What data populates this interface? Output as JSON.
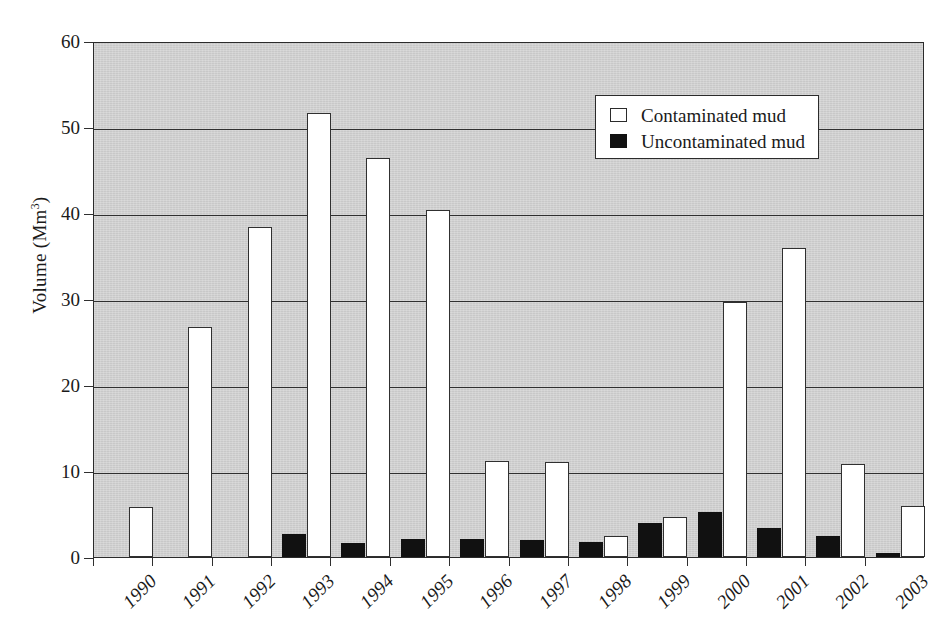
{
  "chart_data": {
    "type": "bar",
    "title": "",
    "xlabel": "",
    "ylabel": "Volume (Mm3)",
    "ylabel_base": "Volume (Mm",
    "ylabel_sup": "3",
    "ylabel_tail": ")",
    "ylim": [
      0,
      60
    ],
    "ytick_labels": [
      "60",
      "50",
      "40",
      "30",
      "20",
      "10",
      "0"
    ],
    "ytick_values": [
      60,
      50,
      40,
      30,
      20,
      10,
      0
    ],
    "grid": true,
    "grid_axis": "y",
    "legend_position": "top-right",
    "categories": [
      "1990",
      "1991",
      "1992",
      "1993",
      "1994",
      "1995",
      "1996",
      "1997",
      "1998",
      "1999",
      "2000",
      "2001",
      "2002",
      "2003"
    ],
    "series": [
      {
        "name": "Contaminated mud",
        "color": "#ffffff",
        "edge_color": "#303030",
        "values": [
          5.8,
          26.8,
          38.4,
          51.6,
          46.4,
          40.3,
          11.2,
          11.1,
          2.4,
          4.6,
          29.7,
          35.9,
          10.8,
          5.9
        ]
      },
      {
        "name": "Uncontaminated mud",
        "color": "#111111",
        "edge_color": "#111111",
        "values": [
          0,
          0,
          0,
          2.7,
          1.6,
          2.1,
          2.1,
          2.0,
          1.8,
          4.0,
          5.2,
          3.4,
          2.4,
          0.5
        ]
      }
    ],
    "plot_background": "#cfcfcf",
    "axis_color": "#2b2b2b"
  },
  "legend": {
    "items": [
      {
        "label": "Contaminated mud",
        "swatch": "contaminated"
      },
      {
        "label": "Uncontaminated mud",
        "swatch": "uncontaminated"
      }
    ]
  }
}
